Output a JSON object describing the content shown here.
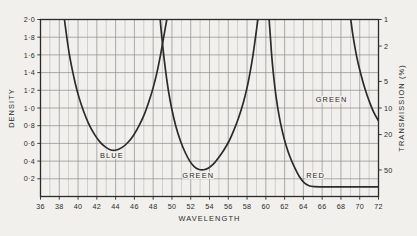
{
  "chart_data": {
    "type": "line",
    "title": "",
    "subtitle": "",
    "xlabel": "WAVELENGTH",
    "ylabel": "DENSITY",
    "y2label": "TRANSMISSION (%)",
    "xlim": [
      36,
      72
    ],
    "ylim": [
      0,
      2.0
    ],
    "grid": true,
    "legend": "inline-annotations",
    "x_ticks": [
      36,
      38,
      40,
      42,
      44,
      46,
      48,
      50,
      52,
      54,
      56,
      58,
      60,
      62,
      64,
      66,
      68,
      70,
      72
    ],
    "x_tick_labels": [
      "36",
      "38",
      "40",
      "42",
      "44",
      "46",
      "48",
      "50",
      "52",
      "54",
      "56",
      "58",
      "60",
      "62",
      "64",
      "66",
      "68",
      "70",
      "72"
    ],
    "y_ticks": [
      0.2,
      0.4,
      0.6,
      0.8,
      1.0,
      1.2,
      1.4,
      1.6,
      1.8,
      2.0
    ],
    "y_tick_labels": [
      "0·2",
      "0·4",
      "0·6",
      "0·8",
      "1·0",
      "1·2",
      "1·4",
      "1·6",
      "1·8",
      "2·0"
    ],
    "y2_ticks_density": [
      2.0,
      1.7,
      1.3,
      1.0,
      0.7,
      0.3
    ],
    "y2_tick_labels": [
      "1",
      "2",
      "5",
      "10",
      "20",
      "50"
    ],
    "annotations": [
      {
        "text": "BLUE",
        "x": 43.6,
        "y": 0.44
      },
      {
        "text": "GREEN",
        "x": 52.8,
        "y": 0.205
      },
      {
        "text": "RED",
        "x": 65.3,
        "y": 0.205
      },
      {
        "text": "GREEN",
        "x": 67.0,
        "y": 1.07
      }
    ],
    "series": [
      {
        "name": "BLUE",
        "color": "#2b2b2b",
        "points": [
          [
            38.55,
            2.0
          ],
          [
            38.8,
            1.8
          ],
          [
            39.05,
            1.62
          ],
          [
            39.35,
            1.45
          ],
          [
            39.7,
            1.28
          ],
          [
            40.1,
            1.12
          ],
          [
            40.6,
            0.96
          ],
          [
            41.1,
            0.83
          ],
          [
            41.7,
            0.71
          ],
          [
            42.3,
            0.62
          ],
          [
            42.9,
            0.56
          ],
          [
            43.5,
            0.525
          ],
          [
            44.1,
            0.525
          ],
          [
            44.7,
            0.555
          ],
          [
            45.3,
            0.61
          ],
          [
            45.9,
            0.69
          ],
          [
            46.5,
            0.8
          ],
          [
            47.1,
            0.94
          ],
          [
            47.6,
            1.09
          ],
          [
            48.0,
            1.23
          ],
          [
            48.4,
            1.4
          ],
          [
            48.75,
            1.58
          ],
          [
            49.05,
            1.76
          ],
          [
            49.35,
            1.94
          ],
          [
            49.45,
            2.0
          ]
        ]
      },
      {
        "name": "GREEN",
        "color": "#2b2b2b",
        "points": [
          [
            48.75,
            2.0
          ],
          [
            48.9,
            1.82
          ],
          [
            49.1,
            1.62
          ],
          [
            49.35,
            1.4
          ],
          [
            49.65,
            1.18
          ],
          [
            50.0,
            0.98
          ],
          [
            50.4,
            0.8
          ],
          [
            50.9,
            0.63
          ],
          [
            51.4,
            0.5
          ],
          [
            51.9,
            0.4
          ],
          [
            52.4,
            0.335
          ],
          [
            52.9,
            0.305
          ],
          [
            53.4,
            0.302
          ],
          [
            53.9,
            0.322
          ],
          [
            54.4,
            0.365
          ],
          [
            54.9,
            0.43
          ],
          [
            55.5,
            0.52
          ],
          [
            56.1,
            0.63
          ],
          [
            56.6,
            0.75
          ],
          [
            57.1,
            0.89
          ],
          [
            57.6,
            1.06
          ],
          [
            58.0,
            1.23
          ],
          [
            58.35,
            1.42
          ],
          [
            58.65,
            1.61
          ],
          [
            58.9,
            1.8
          ],
          [
            59.15,
            2.0
          ]
        ]
      },
      {
        "name": "RED",
        "color": "#2b2b2b",
        "points": [
          [
            60.35,
            2.0
          ],
          [
            60.5,
            1.78
          ],
          [
            60.65,
            1.56
          ],
          [
            60.85,
            1.34
          ],
          [
            61.1,
            1.12
          ],
          [
            61.4,
            0.92
          ],
          [
            61.75,
            0.74
          ],
          [
            62.15,
            0.58
          ],
          [
            62.6,
            0.44
          ],
          [
            63.1,
            0.32
          ],
          [
            63.6,
            0.22
          ],
          [
            64.1,
            0.155
          ],
          [
            64.6,
            0.122
          ],
          [
            65.2,
            0.112
          ],
          [
            66.5,
            0.108
          ],
          [
            68.5,
            0.108
          ],
          [
            70.5,
            0.108
          ],
          [
            72.0,
            0.108
          ]
        ]
      },
      {
        "name": "GREEN-RIGHT",
        "color": "#2b2b2b",
        "points": [
          [
            69.05,
            2.0
          ],
          [
            69.25,
            1.84
          ],
          [
            69.5,
            1.68
          ],
          [
            69.8,
            1.52
          ],
          [
            70.15,
            1.37
          ],
          [
            70.55,
            1.22
          ],
          [
            71.0,
            1.08
          ],
          [
            71.5,
            0.95
          ],
          [
            72.0,
            0.855
          ]
        ]
      }
    ]
  },
  "axes": {
    "x_title": "WAVELENGTH",
    "y_title": "DENSITY",
    "y2_title": "TRANSMISSION (%)"
  },
  "colors": {
    "ink": "#2b2b2b",
    "grid": "#8b8b8b",
    "paper": "#f2f0ec"
  }
}
